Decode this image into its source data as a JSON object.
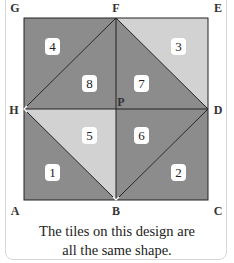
{
  "figure": {
    "vertices": {
      "G": "G",
      "F": "F",
      "E": "E",
      "H": "H",
      "P": "P",
      "D": "D",
      "A": "A",
      "B": "B",
      "C": "C"
    },
    "tiles": [
      {
        "id": "1",
        "label": "1",
        "fill": "#8c8c8c"
      },
      {
        "id": "2",
        "label": "2",
        "fill": "#8c8c8c"
      },
      {
        "id": "3",
        "label": "3",
        "fill": "#d2d2d2"
      },
      {
        "id": "4",
        "label": "4",
        "fill": "#8c8c8c"
      },
      {
        "id": "5",
        "label": "5",
        "fill": "#d2d2d2"
      },
      {
        "id": "6",
        "label": "6",
        "fill": "#8c8c8c"
      },
      {
        "id": "7",
        "label": "7",
        "fill": "#8c8c8c"
      },
      {
        "id": "8",
        "label": "8",
        "fill": "#8c8c8c"
      }
    ],
    "colors": {
      "dark": "#8c8c8c",
      "light": "#d2d2d2",
      "line": "#222222"
    }
  },
  "caption": {
    "line1": "The tiles on this design are",
    "line2": "all the same shape."
  }
}
